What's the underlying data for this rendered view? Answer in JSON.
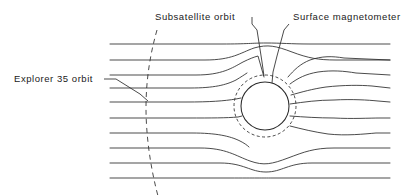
{
  "figure": {
    "width": 420,
    "height": 196,
    "background": "#ffffff",
    "line_color": "#2b2b2b"
  },
  "labels": {
    "subsatellite": "Subsatellite orbit",
    "magnetometer": "Surface magnetometer",
    "explorer": "Explorer 35 orbit"
  },
  "moon": {
    "name": "moon-body",
    "cx": 265,
    "cy": 106,
    "r": 24,
    "fill": "#ffffff",
    "stroke": "#2b2b2b"
  },
  "subsatellite_orbit": {
    "name": "subsatellite-orbit-circle",
    "cx": 265,
    "cy": 106,
    "r": 31,
    "dash": "3,2.4",
    "stroke": "#2b2b2b"
  },
  "explorer_orbit": {
    "name": "explorer-35-orbit-path",
    "dash": "5,4",
    "stroke": "#2b2b2b",
    "path": "M 157 30 C 149 58, 146 84, 146 108 C 146 134, 150 166, 158 196"
  },
  "leaders": {
    "subsatellite": "M 252 17 L 252 24 L 257 30 L 262 62 L 264 76",
    "magnetometer": "M 289 24 L 284 30 L 277 56 L 273 72 L 272 83",
    "explorer": "M 104 79 L 116 79 L 140 94 L 148 101"
  },
  "field_lines": {
    "count": 10,
    "left_x": 110,
    "right_x": 390,
    "paths": [
      "M 110 44 L 222 44 C 248 44, 252 43, 266 43 C 282 43, 290 44, 310 44 L 390 44",
      "M 110 60 L 205 60 C 232 60, 240 53, 254 48 C 268 44, 276 46, 292 52 C 308 58, 318 60, 336 60 L 390 60",
      "M 110 75 L 196 75 C 222 75, 232 68, 243 62 C 249 59, 254 57, 258 56 L 264 77",
      "M 110 88 L 190 88 C 214 88, 226 85, 236 80 C 241 77, 244 75, 247 73",
      "M 110 102 L 186 102 C 210 102, 224 101, 236 99 L 241 98",
      "M 110 118 L 188 118 C 212 118, 226 118, 238 117 L 242 116",
      "M 110 133 L 192 133 C 216 133, 230 136, 240 141 C 244 143, 247 145, 249 147",
      "M 110 148 L 200 148 C 226 148, 236 156, 250 161 C 264 166, 272 164, 288 158 C 304 152, 314 148, 334 148 L 390 148",
      "M 110 163 L 220 163 C 244 163, 250 172, 266 172 C 282 172, 288 163, 312 163 L 390 163",
      "M 110 178 L 230 178 C 256 178, 262 178, 272 178 L 390 178"
    ],
    "right_paths": [
      "M 288 77 C 294 70, 300 64, 310 60 C 322 56, 332 56, 344 58 L 390 60",
      "M 290 84 C 298 78, 306 74, 318 72 C 332 70, 344 71, 356 73 L 390 75",
      "M 291 95 C 302 92, 312 89, 326 87 C 344 85, 360 85, 372 86 L 390 88",
      "M 290 104 C 304 102, 318 100, 334 100 C 352 99, 368 100, 378 101 L 390 102",
      "M 290 116 C 304 117, 318 118, 334 118 C 352 119, 370 118, 380 118 L 390 118",
      "M 290 126 C 302 129, 314 132, 328 134 C 346 136, 364 134, 376 133 L 390 133"
    ]
  }
}
